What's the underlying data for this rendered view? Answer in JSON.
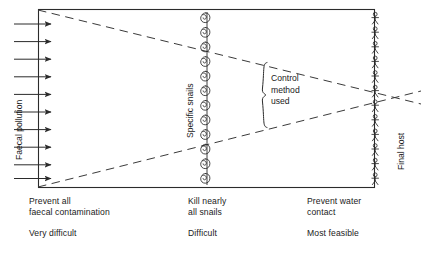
{
  "diagram": {
    "box": {
      "left": 38,
      "top": 9,
      "right": 375,
      "bottom": 188
    },
    "colors": {
      "ink": "#1a1a1a",
      "background": "#ffffff",
      "line": "#2b2b2b",
      "dashed": "#3a3a3a"
    },
    "vertical_labels": {
      "left": "Faecal pollution",
      "middle": "Specific snails",
      "right": "Final host"
    },
    "brace_label": "Control\nmethod\nused",
    "columns": [
      {
        "id": "faecal",
        "action": "Prevent all\nfaecal contamination",
        "feasibility": "Very difficult",
        "icon": "arrow-right-icon",
        "icon_count": 10
      },
      {
        "id": "snails",
        "action": "Kill nearly\nall snails",
        "feasibility": "Difficult",
        "icon": "snail-shell-icon",
        "icon_count": 12
      },
      {
        "id": "water",
        "action": "Prevent water\ncontact",
        "feasibility": "Most feasible",
        "icon": "stick-figure-person-icon",
        "icon_count": 12
      }
    ],
    "arrows": {
      "count": 10,
      "x_start": 14,
      "x_end": 52,
      "y_first": 24,
      "y_spacing": 17.6
    },
    "snails": {
      "count": 12,
      "x": 205,
      "y_first": 18,
      "y_spacing": 14.6
    },
    "people": {
      "count": 12,
      "x": 375,
      "y_first": 20,
      "y_spacing": 14.6
    },
    "dashed_lines": [
      {
        "name": "upper-wedge",
        "x1": 38,
        "y1": 10,
        "x2": 420,
        "y2": 104
      },
      {
        "name": "lower-wedge",
        "x1": 38,
        "y1": 187,
        "x2": 420,
        "y2": 91
      }
    ]
  }
}
